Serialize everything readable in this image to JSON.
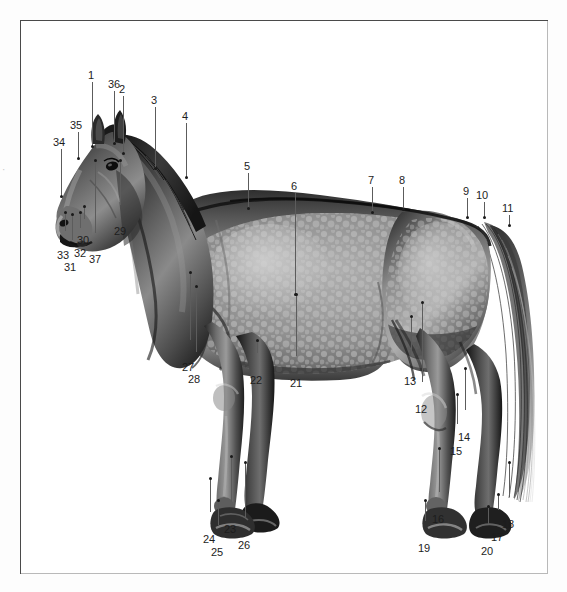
{
  "plate": {
    "title": "Horse exterior anatomy numbered plate",
    "subject": "dapple grey horse, left lateral view",
    "background_color": "#ffffff",
    "frame_color": "#4a4a4a",
    "leader_color": "#5c5c5c",
    "label_color": "#1d1d1d",
    "edge_mark": "·"
  },
  "labels": [
    {
      "id": "1",
      "text": "1",
      "x": 88,
      "y": 70,
      "lx": 92,
      "ly": 82,
      "lh": 64,
      "px": 92,
      "py": 146
    },
    {
      "id": "36",
      "text": "36",
      "x": 108,
      "y": 79,
      "lx": 114,
      "ly": 91,
      "lh": 52,
      "px": 114,
      "py": 143
    },
    {
      "id": "2",
      "text": "2",
      "x": 119,
      "y": 84,
      "lx": 123,
      "ly": 96,
      "lh": 57,
      "px": 123,
      "py": 153
    },
    {
      "id": "3",
      "text": "3",
      "x": 151,
      "y": 95,
      "lx": 155,
      "ly": 107,
      "lh": 61,
      "px": 155,
      "py": 168
    },
    {
      "id": "4",
      "text": "4",
      "x": 182,
      "y": 111,
      "lx": 186,
      "ly": 123,
      "lh": 54,
      "px": 186,
      "py": 177
    },
    {
      "id": "35",
      "text": "35",
      "x": 70,
      "y": 120,
      "lx": 78,
      "ly": 132,
      "lh": 26,
      "px": 78,
      "py": 158
    },
    {
      "id": "34",
      "text": "34",
      "x": 53,
      "y": 137,
      "lx": 61,
      "ly": 149,
      "lh": 47,
      "px": 61,
      "py": 196
    },
    {
      "id": "5",
      "text": "5",
      "x": 244,
      "y": 161,
      "lx": 248,
      "ly": 173,
      "lh": 35,
      "px": 248,
      "py": 208
    },
    {
      "id": "6",
      "text": "6",
      "x": 291,
      "y": 181,
      "lx": 295,
      "ly": 193,
      "lh": 101,
      "px": 295,
      "py": 294
    },
    {
      "id": "7",
      "text": "7",
      "x": 368,
      "y": 175,
      "lx": 372,
      "ly": 187,
      "lh": 25,
      "px": 372,
      "py": 212
    },
    {
      "id": "8",
      "text": "8",
      "x": 399,
      "y": 175,
      "lx": 403,
      "ly": 187,
      "lh": 22,
      "px": 403,
      "py": 209
    },
    {
      "id": "9",
      "text": "9",
      "x": 463,
      "y": 186,
      "lx": 467,
      "ly": 198,
      "lh": 19,
      "px": 467,
      "py": 217
    },
    {
      "id": "10",
      "text": "10",
      "x": 476,
      "y": 190,
      "lx": 484,
      "ly": 202,
      "lh": 15,
      "px": 484,
      "py": 217
    },
    {
      "id": "11",
      "text": "11",
      "x": 502,
      "y": 203,
      "lx": 509,
      "ly": 215,
      "lh": 10,
      "px": 509,
      "py": 225
    },
    {
      "id": "33",
      "text": "33",
      "x": 57,
      "y": 250,
      "lx": 65,
      "ly": 231,
      "lh": 19,
      "px": 65,
      "py": 231,
      "up": true,
      "ltop": 212
    },
    {
      "id": "32",
      "text": "32",
      "x": 74,
      "y": 248,
      "lx": 80,
      "ly": 228,
      "lh": 20,
      "px": 80,
      "py": 228,
      "up": true,
      "ltop": 212
    },
    {
      "id": "31",
      "text": "31",
      "x": 64,
      "y": 262,
      "lx": 72,
      "ly": 240,
      "lh": 22,
      "px": 72,
      "py": 240,
      "up": true,
      "ltop": 214
    },
    {
      "id": "30",
      "text": "30",
      "x": 77,
      "y": 235,
      "lx": 84,
      "ly": 219,
      "lh": 16,
      "px": 84,
      "py": 219,
      "up": true,
      "ltop": 206
    },
    {
      "id": "37",
      "text": "37",
      "x": 89,
      "y": 254,
      "lx": 95,
      "ly": 233,
      "lh": 21,
      "px": 95,
      "py": 233,
      "up": true,
      "ltop": 160
    },
    {
      "id": "29",
      "text": "29",
      "x": 114,
      "y": 226,
      "lx": 120,
      "ly": 205,
      "lh": 21,
      "px": 120,
      "py": 205,
      "up": true,
      "ltop": 160
    },
    {
      "id": "27",
      "text": "27",
      "x": 182,
      "y": 362,
      "lx": 190,
      "ly": 340,
      "lh": 22,
      "px": 190,
      "py": 340,
      "up": true,
      "ltop": 272
    },
    {
      "id": "28",
      "text": "28",
      "x": 188,
      "y": 374,
      "lx": 196,
      "ly": 352,
      "lh": 22,
      "px": 196,
      "py": 352,
      "up": true,
      "ltop": 286
    },
    {
      "id": "22",
      "text": "22",
      "x": 250,
      "y": 375,
      "lx": 257,
      "ly": 353,
      "lh": 22,
      "px": 257,
      "py": 353,
      "up": true,
      "ltop": 340
    },
    {
      "id": "21",
      "text": "21",
      "x": 290,
      "y": 378,
      "lx": 296,
      "ly": 356,
      "lh": 22,
      "px": 296,
      "py": 356,
      "up": true,
      "ltop": 294
    },
    {
      "id": "13",
      "text": "13",
      "x": 404,
      "y": 376,
      "lx": 411,
      "ly": 354,
      "lh": 22,
      "px": 411,
      "py": 354,
      "up": true,
      "ltop": 316
    },
    {
      "id": "12",
      "text": "12",
      "x": 415,
      "y": 404,
      "lx": 422,
      "ly": 382,
      "lh": 22,
      "px": 422,
      "py": 382,
      "up": true,
      "ltop": 302
    },
    {
      "id": "14",
      "text": "14",
      "x": 458,
      "y": 432,
      "lx": 465,
      "ly": 410,
      "lh": 22,
      "px": 465,
      "py": 410,
      "up": true,
      "ltop": 368
    },
    {
      "id": "15",
      "text": "15",
      "x": 450,
      "y": 446,
      "lx": 457,
      "ly": 424,
      "lh": 22,
      "px": 457,
      "py": 424,
      "up": true,
      "ltop": 394
    },
    {
      "id": "24",
      "text": "24",
      "x": 203,
      "y": 534,
      "lx": 210,
      "ly": 512,
      "lh": 22,
      "px": 210,
      "py": 512,
      "up": true,
      "ltop": 478
    },
    {
      "id": "25",
      "text": "25",
      "x": 211,
      "y": 547,
      "lx": 218,
      "ly": 525,
      "lh": 22,
      "px": 218,
      "py": 525,
      "up": true,
      "ltop": 500
    },
    {
      "id": "23",
      "text": "23",
      "x": 224,
      "y": 524,
      "lx": 231,
      "ly": 502,
      "lh": 22,
      "px": 231,
      "py": 502,
      "up": true,
      "ltop": 456
    },
    {
      "id": "26",
      "text": "26",
      "x": 238,
      "y": 540,
      "lx": 245,
      "ly": 518,
      "lh": 22,
      "px": 245,
      "py": 518,
      "up": true,
      "ltop": 462
    },
    {
      "id": "16",
      "text": "16",
      "x": 432,
      "y": 514,
      "lx": 439,
      "ly": 492,
      "lh": 22,
      "px": 439,
      "py": 492,
      "up": true,
      "ltop": 448
    },
    {
      "id": "19",
      "text": "19",
      "x": 418,
      "y": 543,
      "lx": 425,
      "ly": 521,
      "lh": 22,
      "px": 425,
      "py": 521,
      "up": true,
      "ltop": 500
    },
    {
      "id": "18",
      "text": "18",
      "x": 502,
      "y": 519,
      "lx": 509,
      "ly": 497,
      "lh": 22,
      "px": 509,
      "py": 497,
      "up": true,
      "ltop": 462
    },
    {
      "id": "17",
      "text": "17",
      "x": 491,
      "y": 532,
      "lx": 498,
      "ly": 510,
      "lh": 22,
      "px": 498,
      "py": 510,
      "up": true,
      "ltop": 494
    },
    {
      "id": "20",
      "text": "20",
      "x": 481,
      "y": 546,
      "lx": 488,
      "ly": 524,
      "lh": 22,
      "px": 488,
      "py": 524,
      "up": true,
      "ltop": 506
    }
  ]
}
